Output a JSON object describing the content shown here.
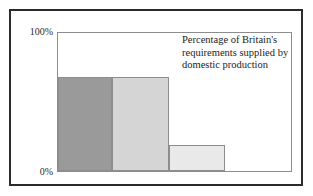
{
  "chart_data": {
    "type": "bar",
    "title": "",
    "caption_lines": [
      "Percentage of Britain's",
      "requirements supplied by",
      "domestic production"
    ],
    "caption": "Percentage of Britain's requirements supplied by domestic production",
    "categories": [
      "",
      "",
      ""
    ],
    "values": [
      68,
      68,
      19
    ],
    "xlabel": "",
    "ylabel": "",
    "ylim": [
      0,
      100
    ],
    "ytick_labels": [
      "100%",
      "0%"
    ],
    "ytick_values": [
      100,
      0
    ],
    "grid": false,
    "legend": "none",
    "bar_colors": [
      "#9a9a9a",
      "#d5d5d5",
      "#e9e9e9"
    ],
    "bar_border_color": "#8d8d8d",
    "bars": [
      {
        "value": 68,
        "fill": "#9a9a9a",
        "left_pct": 0.0,
        "width_pct": 23.0
      },
      {
        "value": 68,
        "fill": "#d5d5d5",
        "left_pct": 23.0,
        "width_pct": 24.7
      },
      {
        "value": 19,
        "fill": "#e9e9e9",
        "left_pct": 47.7,
        "width_pct": 23.8
      }
    ]
  },
  "figure": {
    "border_color": "#2b2b2b",
    "plot_frame_color": "#8d8d8d",
    "background": "#ffffff"
  }
}
